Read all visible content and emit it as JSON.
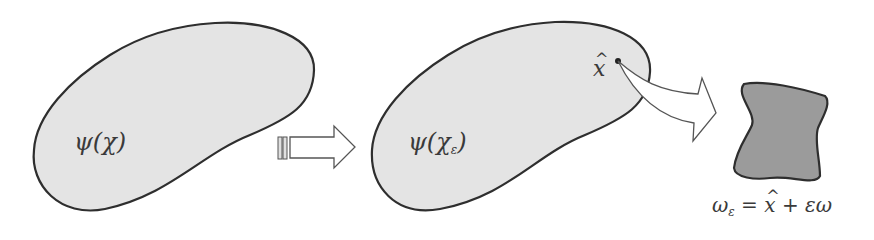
{
  "figure": {
    "left_domain": {
      "label": "ψ(χ)",
      "fill": "#e4e4e4",
      "stroke": "#2e2e2e"
    },
    "transition_arrow": {
      "direction": "right",
      "style": "hollow-block-with-tail-stripes"
    },
    "middle_domain": {
      "label_main": "ψ(χ",
      "label_sub": "ε",
      "label_close": ")",
      "fill": "#e4e4e4",
      "stroke": "#2e2e2e",
      "point": {
        "label": "x",
        "hat": "^"
      }
    },
    "zoom_arrow": {
      "style": "hollow-curved",
      "from": "point x̂",
      "to": "inclusion shape"
    },
    "inclusion": {
      "fill": "#9b9b9b",
      "stroke": "#2e2e2e"
    },
    "formula": {
      "lhs": "ω",
      "lhs_sub": "ε",
      "eq": " = ",
      "xhat": "x",
      "plus": " + ",
      "rhs": "εω"
    }
  }
}
